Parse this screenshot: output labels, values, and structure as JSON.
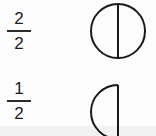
{
  "items": [
    {
      "numerator": "2",
      "denominator": "2",
      "shape": "full-circle-halved"
    },
    {
      "numerator": "1",
      "denominator": "2",
      "shape": "half-circle"
    }
  ],
  "colors": {
    "stroke": "#1a1a1a",
    "background": "#fdfdfd"
  }
}
